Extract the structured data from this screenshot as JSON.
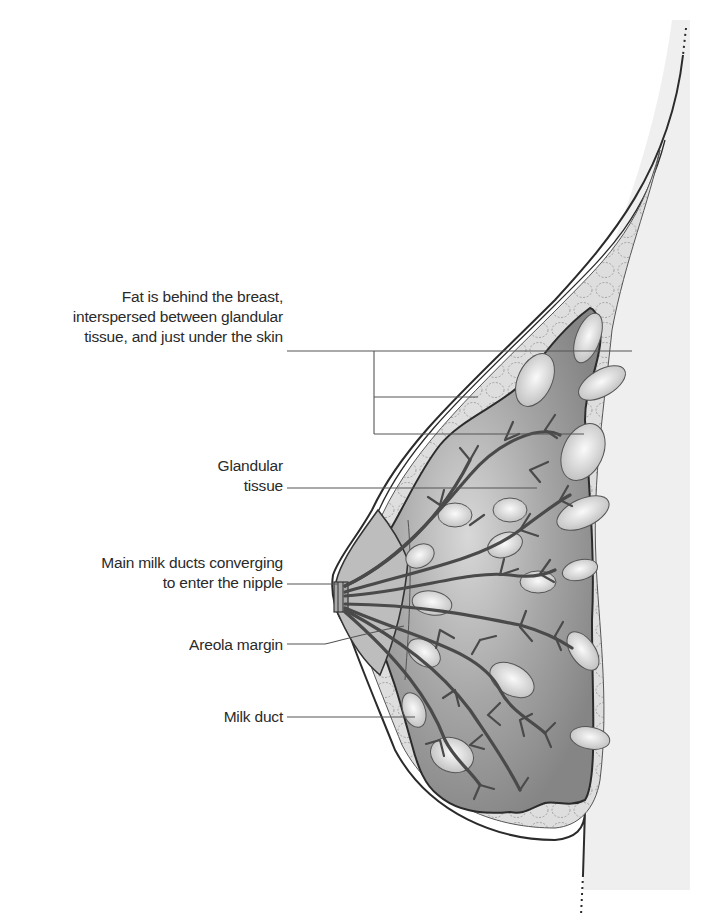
{
  "figure": {
    "colors": {
      "background": "#ffffff",
      "skin_shading": "#ececec",
      "fat_layer": "#d9d9d9",
      "glandular_tissue": "#8f8f8f",
      "glandular_tissue_light": "#c4c4c4",
      "ducts": "#4a4a4a",
      "lobules": "#e3e3e3",
      "outline": "#2b2b2b",
      "leader_lines": "#555555",
      "label_text": "#2a2a2a"
    }
  },
  "labels": [
    {
      "id": "fat",
      "lines": [
        "Fat is behind the breast,",
        "interspersed between glandular",
        "tissue, and just under the skin"
      ]
    },
    {
      "id": "glandular",
      "lines": [
        "Glandular",
        "tissue"
      ]
    },
    {
      "id": "main-ducts",
      "lines": [
        "Main milk ducts converging",
        "to enter the nipple"
      ]
    },
    {
      "id": "areola",
      "lines": [
        "Areola margin"
      ]
    },
    {
      "id": "milk-duct",
      "lines": [
        "Milk duct"
      ]
    }
  ]
}
